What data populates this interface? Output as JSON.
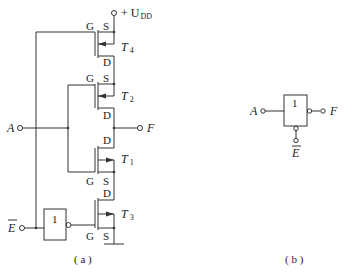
{
  "figure_a": {
    "supply_label": "+ U",
    "supply_sub": "DD",
    "input_a": "A",
    "output_f": "F",
    "enable_bar": "E",
    "not_gate_label": "1",
    "caption": "( a )",
    "transistors": [
      {
        "name": "T",
        "sub": "4",
        "gate": "G",
        "source": "S",
        "drain": "D"
      },
      {
        "name": "T",
        "sub": "2",
        "gate": "G",
        "source": "S",
        "drain": "D"
      },
      {
        "name": "T",
        "sub": "1",
        "gate": "G",
        "source": "S",
        "drain": "D"
      },
      {
        "name": "T",
        "sub": "3",
        "gate": "G",
        "source": "S",
        "drain": "D"
      }
    ]
  },
  "figure_b": {
    "input_a": "A",
    "output_f": "F",
    "enable_bar": "E",
    "gate_label": "1",
    "caption": "( b )"
  },
  "colors": {
    "line": "#333333",
    "text": "#222222"
  }
}
